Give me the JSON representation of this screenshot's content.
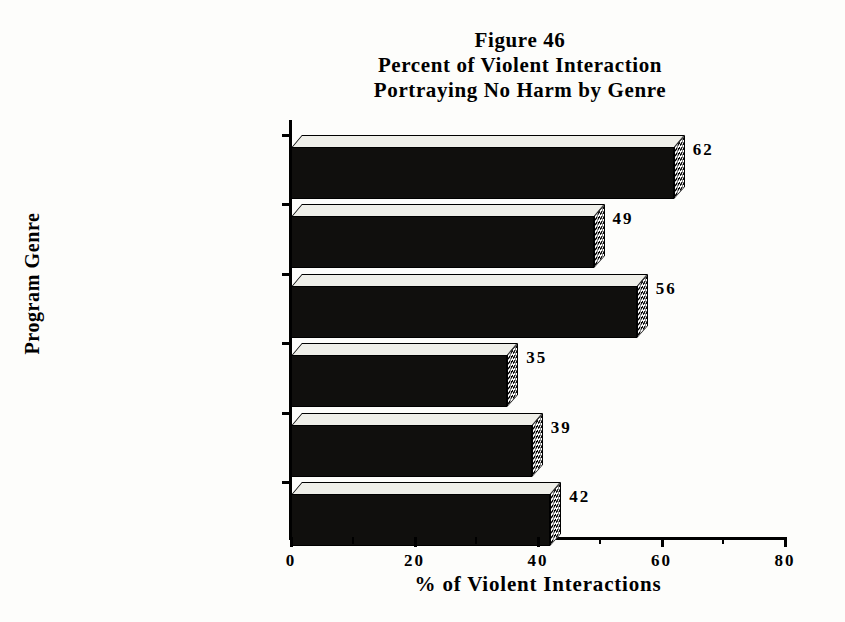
{
  "figure": {
    "title_line1": "Figure 46",
    "title_line2": "Percent of Violent Interaction",
    "title_line3": "Portraying No Harm by Genre"
  },
  "axes": {
    "y_title": "Program Genre",
    "x_title": "% of Violent Interactions"
  },
  "chart_data": {
    "type": "bar",
    "orientation": "horizontal",
    "subtitle": "Portraying No Harm by Genre",
    "xlabel": "% of Violent Interactions",
    "ylabel": "Program Genre",
    "categories": [
      "Children Series",
      "Comedy Series",
      "Music Videos",
      "Movies",
      "Drama Series",
      "Reality Based"
    ],
    "values": [
      62,
      49,
      56,
      35,
      39,
      42
    ],
    "value_labels": [
      "62",
      "49",
      "56",
      "35",
      "39",
      "42"
    ],
    "xlim": [
      0,
      80
    ],
    "xticks": [
      0,
      20,
      40,
      60,
      80
    ],
    "xtick_labels": [
      "0",
      "20",
      "40",
      "60",
      "80"
    ],
    "xtick_minor_step": 10,
    "grid": false,
    "legend": null,
    "style": {
      "bar_fill": "#100f0d",
      "bar_top_fill": "#efefe9",
      "bar_side_pattern": "checkered",
      "three_d": true,
      "background": "#fdfdfb"
    }
  }
}
